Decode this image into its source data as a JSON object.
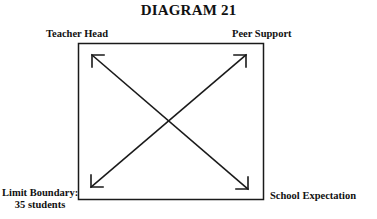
{
  "diagram": {
    "title": "DIAGRAM 21",
    "corners": {
      "top_left": "Teacher Head",
      "top_right": "Peer Support",
      "bottom_left_line1": "Limit Boundary:",
      "bottom_left_line2": "35 students",
      "bottom_right": "School Expectation"
    },
    "box": {
      "x": 78,
      "y": 43,
      "width": 185,
      "height": 156
    },
    "arrows": [
      {
        "from": "top_left",
        "to": "bottom_right",
        "bidirectional": true
      },
      {
        "from": "bottom_left",
        "to": "top_right",
        "bidirectional": true
      }
    ],
    "stroke_color": "#1a1a1a"
  }
}
